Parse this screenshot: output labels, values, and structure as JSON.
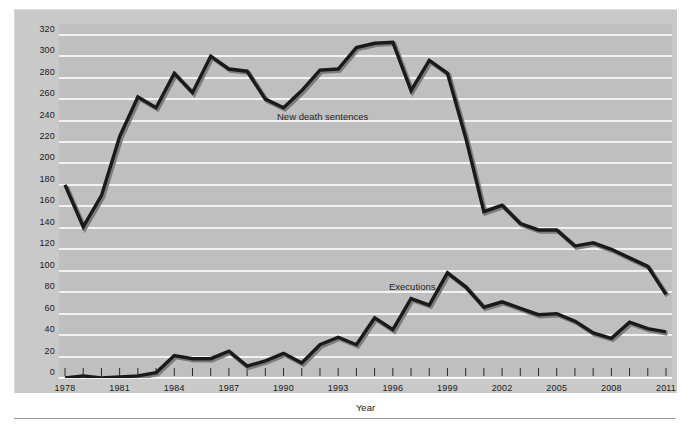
{
  "chart_data": {
    "type": "line",
    "title": "",
    "xlabel": "Year",
    "ylabel": "",
    "xlim": [
      1978,
      2011
    ],
    "ylim": [
      0,
      330
    ],
    "ytick_step": 20,
    "yticks": [
      0,
      20,
      40,
      60,
      80,
      100,
      120,
      140,
      160,
      180,
      200,
      220,
      240,
      260,
      280,
      300,
      320
    ],
    "xticks_labeled": [
      1978,
      1981,
      1984,
      1987,
      1990,
      1993,
      1996,
      1999,
      2002,
      2005,
      2008,
      2011
    ],
    "xtick_interval_minor": 1,
    "grid": "horizontal",
    "legend": "inline-annotations",
    "x": [
      1978,
      1979,
      1980,
      1981,
      1982,
      1983,
      1984,
      1985,
      1986,
      1987,
      1988,
      1989,
      1990,
      1991,
      1992,
      1993,
      1994,
      1995,
      1996,
      1997,
      1998,
      1999,
      2000,
      2001,
      2002,
      2003,
      2004,
      2005,
      2006,
      2007,
      2008,
      2009,
      2010,
      2011
    ],
    "series": [
      {
        "name": "New death sentences",
        "color": "#1a1a1a",
        "label_text": "New death sentences",
        "values": [
          180,
          141,
          170,
          225,
          262,
          252,
          284,
          266,
          300,
          288,
          286,
          260,
          252,
          268,
          287,
          288,
          308,
          312,
          313,
          268,
          296,
          284,
          224,
          155,
          161,
          144,
          138,
          138,
          123,
          126,
          120,
          112,
          104,
          78
        ]
      },
      {
        "name": "Executions",
        "color": "#1a1a1a",
        "label_text": "Executions",
        "values": [
          0,
          2,
          0,
          1,
          2,
          5,
          21,
          18,
          18,
          25,
          11,
          16,
          23,
          14,
          31,
          38,
          31,
          56,
          45,
          74,
          68,
          98,
          85,
          66,
          71,
          65,
          59,
          60,
          53,
          42,
          37,
          52,
          46,
          43
        ]
      }
    ],
    "annotations": [
      {
        "text": "New death sentences",
        "x": 1992,
        "y": 244
      },
      {
        "text": "Executions",
        "x": 1997,
        "y": 80
      }
    ]
  },
  "axis": {
    "x_title": "Year"
  },
  "colors": {
    "plot_background": "#bfbfbf",
    "panel_background": "#c9c9c9",
    "gridline": "#f2f2f2",
    "line": "#1a1a1a",
    "text": "#1b1b1b"
  }
}
